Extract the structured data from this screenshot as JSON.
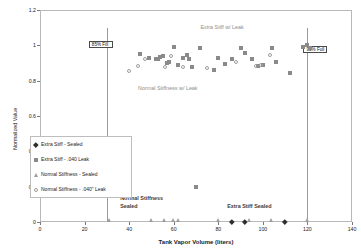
{
  "chart_data": {
    "type": "scatter",
    "title": "",
    "xlabel": "Tank Vapor Volume (liters)",
    "ylabel": "Normalized Value",
    "xlim": [
      0,
      140
    ],
    "ylim": [
      0,
      1.2
    ],
    "xticks": [
      "0",
      "20",
      "40",
      "60",
      "80",
      "100",
      "120",
      "140"
    ],
    "yticks": [
      "0",
      "0.2",
      "0.4",
      "0.6",
      "0.8",
      "1",
      "1.2"
    ],
    "grid": false,
    "legend_position": "center-left",
    "series": [
      {
        "name": "Extra Stiff - Sealed",
        "marker": "diamond-dark",
        "points": [
          [
            86,
            0
          ],
          [
            92,
            0
          ],
          [
            110,
            0
          ]
        ]
      },
      {
        "name": "Extra Stiff - .040 Leak",
        "marker": "sq-filled",
        "points": [
          [
            45,
            0.95
          ],
          [
            49,
            0.93
          ],
          [
            52,
            0.92
          ],
          [
            53,
            0.925
          ],
          [
            54,
            0.935
          ],
          [
            55,
            0.94
          ],
          [
            57,
            0.9
          ],
          [
            58,
            0.905
          ],
          [
            60,
            0.99
          ],
          [
            62,
            0.89
          ],
          [
            64,
            0.93
          ],
          [
            66,
            0.945
          ],
          [
            67,
            0.925
          ],
          [
            68,
            0.88
          ],
          [
            70,
            0.2
          ],
          [
            72,
            0.985
          ],
          [
            78,
            0.86
          ],
          [
            80,
            0.93
          ],
          [
            83,
            0.895
          ],
          [
            86,
            0.92
          ],
          [
            90,
            0.985
          ],
          [
            92,
            0.955
          ],
          [
            95,
            0.92
          ],
          [
            98,
            0.885
          ],
          [
            100,
            0.89
          ],
          [
            104,
            0.985
          ],
          [
            106,
            0.905
          ],
          [
            112,
            0.845
          ],
          [
            118,
            0.99
          ],
          [
            120,
            1.0
          ],
          [
            121,
            0.985
          ]
        ]
      },
      {
        "name": "Normal Stiffness - Sealed",
        "marker": "tri-open",
        "points": [
          [
            31,
            0
          ],
          [
            50,
            0
          ],
          [
            56,
            0
          ],
          [
            60,
            0
          ],
          [
            62,
            0
          ],
          [
            80,
            0
          ],
          [
            94,
            0
          ],
          [
            104,
            0
          ],
          [
            120,
            0
          ]
        ]
      },
      {
        "name": "Normal Stiffness - .040\" Leak",
        "marker": "circ-open",
        "points": [
          [
            40,
            0.855
          ],
          [
            44,
            0.885
          ],
          [
            47,
            0.92
          ],
          [
            56,
            0.875
          ],
          [
            59,
            0.94
          ],
          [
            64,
            0.88
          ],
          [
            75,
            0.87
          ],
          [
            88,
            0.905
          ],
          [
            97,
            0.885
          ],
          [
            99,
            0.89
          ],
          [
            103,
            0.945
          ]
        ]
      }
    ],
    "annotations": [
      {
        "text": "Extra Stiff w/ Leak",
        "x": 72,
        "y": 1.12,
        "style": "light"
      },
      {
        "text": "Normal Stiffness w/ Leak",
        "x": 44,
        "y": 0.775,
        "style": "light"
      },
      {
        "text": "Normal Stiffness",
        "x": 36,
        "y": 0.155,
        "style": "dark"
      },
      {
        "text": "Sealed",
        "x": 36,
        "y": 0.105,
        "style": "dark"
      },
      {
        "text": "Extra Stiff Sealed",
        "x": 84,
        "y": 0.105,
        "style": "dark"
      }
    ],
    "reference_lines": [
      {
        "label": "85% Fill",
        "x": 30
      },
      {
        "label": "95% Full",
        "x": 120
      }
    ]
  },
  "legend": {
    "items": [
      {
        "label": "Extra Stiff - Sealed",
        "marker": "diamond-dark"
      },
      {
        "label": "Extra Stiff - .040 Leak",
        "marker": "sq-filled"
      },
      {
        "label": "Normal Stiffness - Sealed",
        "marker": "tri-open"
      },
      {
        "label": "Normal Stiffness - .040\" Leak",
        "marker": "circ-open"
      }
    ]
  }
}
